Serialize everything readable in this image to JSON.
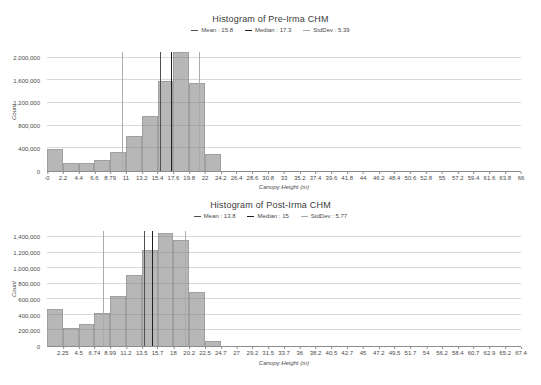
{
  "colors": {
    "bar_fill": "#b7b7b7",
    "bar_edge": "#a0a0a0",
    "mean_line": "#4f4f4f",
    "median_line": "#1f1f1f",
    "stddev_line": "#ababab",
    "gridline": "#d4d4d4",
    "axis": "#8c8c8c"
  },
  "chart_data": [
    {
      "type": "bar",
      "title": "Histogram of Pre-Irma CHM",
      "xlabel": "Canopy Height (m)",
      "ylabel": "Count",
      "legend": [
        {
          "name": "Mean",
          "label": "Mean : 15.8"
        },
        {
          "name": "Median",
          "label": "Median : 17.3"
        },
        {
          "name": "StdDev",
          "label": "StdDev : 5.39"
        }
      ],
      "mean": 15.8,
      "median": 17.3,
      "stddev": 5.39,
      "bin_width": 2.2,
      "xlim": [
        0,
        66
      ],
      "ylim": [
        0,
        2100000
      ],
      "x_tick_start": 0,
      "x_tick_labels": [
        "-0",
        "2.2",
        "4.4",
        "6.6",
        "8.79",
        "11",
        "13.2",
        "15.4",
        "17.6",
        "19.8",
        "22",
        "24.2",
        "26.4",
        "28.6",
        "30.8",
        "33",
        "35.2",
        "37.4",
        "39.6",
        "41.8",
        "44",
        "46.2",
        "48.4",
        "50.6",
        "52.8",
        "55",
        "57.2",
        "59.4",
        "61.6",
        "63.8",
        "66"
      ],
      "y_tick_labels": [
        "0",
        "400,000",
        "800,000",
        "1,200,000",
        "1,600,000",
        "2,000,000"
      ],
      "y_tick_values": [
        0,
        400000,
        800000,
        1200000,
        1600000,
        2000000
      ],
      "values": [
        380000,
        140000,
        140000,
        200000,
        340000,
        610000,
        970000,
        1580000,
        2100000,
        1560000,
        300000,
        0,
        0,
        0,
        0,
        0,
        0,
        0,
        0,
        0,
        0,
        0,
        0,
        0,
        0,
        0,
        0,
        0,
        0,
        0
      ]
    },
    {
      "type": "bar",
      "title": "Histogram of Post-Irma CHM",
      "xlabel": "Canopy Height (m)",
      "ylabel": "Count",
      "legend": [
        {
          "name": "Mean",
          "label": "Mean : 13.8"
        },
        {
          "name": "Median",
          "label": "Median : 15"
        },
        {
          "name": "StdDev",
          "label": "StdDev : 5.77"
        }
      ],
      "mean": 13.8,
      "median": 15,
      "stddev": 5.77,
      "bin_width": 2.25,
      "xlim": [
        0,
        67.44
      ],
      "ylim": [
        0,
        1480000
      ],
      "x_tick_start": 1,
      "x_tick_labels": [
        "2.25",
        "4.5",
        "6.74",
        "8.99",
        "11.2",
        "13.5",
        "15.7",
        "18",
        "20.2",
        "22.5",
        "24.7",
        "27",
        "29.2",
        "31.5",
        "33.7",
        "36",
        "38.2",
        "40.5",
        "42.7",
        "45",
        "47.2",
        "49.5",
        "51.7",
        "54",
        "56.2",
        "58.4",
        "60.7",
        "62.9",
        "65.2",
        "67.4"
      ],
      "y_tick_labels": [
        "0",
        "200,000",
        "400,000",
        "600,000",
        "800,000",
        "1,000,000",
        "1,200,000",
        "1,400,000"
      ],
      "y_tick_values": [
        0,
        200000,
        400000,
        600000,
        800000,
        1000000,
        1200000,
        1400000
      ],
      "values": [
        475000,
        230000,
        280000,
        420000,
        645000,
        920000,
        1230000,
        1450000,
        1365000,
        690000,
        65000,
        0,
        0,
        0,
        0,
        0,
        0,
        0,
        0,
        0,
        0,
        0,
        0,
        0,
        0,
        0,
        0,
        0,
        0,
        0
      ]
    }
  ]
}
